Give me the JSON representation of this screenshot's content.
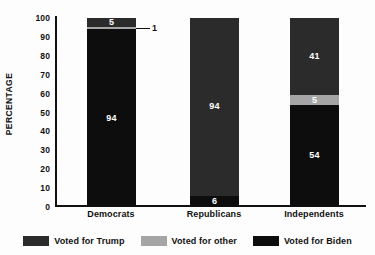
{
  "chart_data": {
    "type": "bar",
    "subtype": "stacked-100",
    "title": "",
    "xlabel": "",
    "ylabel": "PERCENTAGE",
    "ylim": [
      0,
      100
    ],
    "yticks": [
      100,
      90,
      80,
      70,
      60,
      50,
      40,
      30,
      20,
      10,
      0
    ],
    "grid": false,
    "legend_position": "bottom",
    "categories": [
      "Democrats",
      "Republicans",
      "Independents"
    ],
    "series": [
      {
        "name": "Voted for Trump",
        "color": "#2b2b2b",
        "values": [
          5,
          94,
          41
        ]
      },
      {
        "name": "Voted for other",
        "color": "#a5a5a5",
        "values": [
          1,
          0,
          5
        ]
      },
      {
        "name": "Voted for Biden",
        "color": "#0d0d0d",
        "values": [
          94,
          6,
          54
        ]
      }
    ],
    "annotations": [
      {
        "text": "1",
        "category": "Democrats",
        "series": "Voted for other",
        "style": "leader-line"
      }
    ],
    "stack_order_top_to_bottom": [
      "Voted for Trump",
      "Voted for other",
      "Voted for Biden"
    ]
  },
  "legend": {
    "items": [
      {
        "label": "Voted for Trump",
        "color": "#2b2b2b"
      },
      {
        "label": "Voted for other",
        "color": "#a5a5a5"
      },
      {
        "label": "Voted for Biden",
        "color": "#0d0d0d"
      }
    ]
  },
  "colors": {
    "background": "#fdfdfd",
    "axis": "#111111",
    "text": "#111111",
    "trump": "#2b2b2b",
    "other": "#a5a5a5",
    "biden": "#0d0d0d"
  }
}
